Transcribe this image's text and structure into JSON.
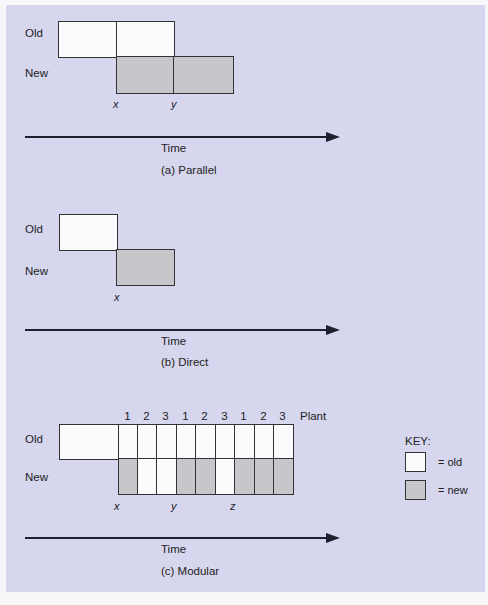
{
  "labels": {
    "old": "Old",
    "new": "New",
    "time": "Time",
    "plant": "Plant"
  },
  "sections": {
    "parallel": {
      "caption": "(a) Parallel",
      "markers": [
        "x",
        "y"
      ]
    },
    "direct": {
      "caption": "(b) Direct",
      "markers": [
        "x"
      ]
    },
    "modular": {
      "caption": "(c) Modular",
      "markers": [
        "x",
        "y",
        "z"
      ],
      "plant_numbers": [
        "1",
        "2",
        "3",
        "1",
        "2",
        "3",
        "1",
        "2",
        "3"
      ],
      "old_row": [
        "old",
        "old",
        "old",
        "old",
        "old",
        "old",
        "old",
        "old",
        "old"
      ],
      "new_row": [
        "new",
        "old",
        "old",
        "new",
        "new",
        "old",
        "new",
        "new",
        "new"
      ]
    }
  },
  "key": {
    "title": "KEY:",
    "old_label": "= old",
    "new_label": "= new"
  },
  "colors": {
    "background": "#d6d6ee",
    "old_fill": "#fbfbfd",
    "new_fill": "#c6c6cb",
    "line": "#333333"
  }
}
